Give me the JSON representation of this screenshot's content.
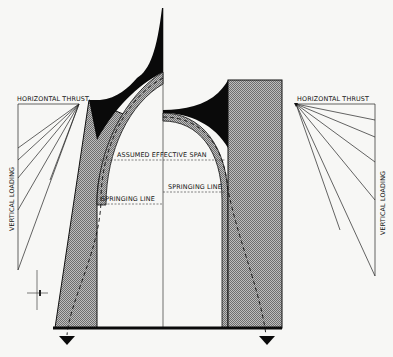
{
  "diagram": {
    "colors": {
      "background": "#f7f7f5",
      "ink": "#111111",
      "hatch_fill": "#9a9a9a",
      "solid_fill": "#0a0a0a"
    },
    "labels": {
      "left_horizontal_thrust": "HORIZONTAL THRUST",
      "left_vertical_loading": "VERTICAL LOADING",
      "right_horizontal_thrust": "HORIZONTAL THRUST",
      "right_vertical_loading": "VERTICAL LOADING",
      "assumed_effective_span": "ASSUMED EFFECTIVE SPAN",
      "springing_line_left": "SPRINGING LINE",
      "springing_line_right": "SPRINGING LINE"
    },
    "icons": {
      "left_reaction_arrow": "down-triangle-arrow",
      "right_reaction_arrow": "down-triangle-arrow",
      "north_mark": "cross-mark"
    },
    "force_diagram_left": {
      "rays": 6
    },
    "force_diagram_right": {
      "rays": 6
    }
  }
}
